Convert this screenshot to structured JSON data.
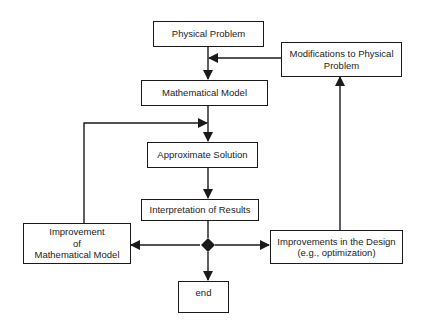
{
  "diagram": {
    "nodes": {
      "physical_problem": "Physical Problem",
      "modifications": "Modifications to Physical\nProblem",
      "mathematical_model": "Mathematical Model",
      "approximate_solution": "Approximate Solution",
      "interpretation": "Interpretation of Results",
      "improvement_model": "Improvement\nof\nMathematical Model",
      "improvements_design": "Improvements in the Design\n(e.g., optimization)",
      "end": "end"
    },
    "edges": [
      {
        "from": "physical_problem",
        "to": "mathematical_model"
      },
      {
        "from": "modifications",
        "to": "mathematical_model"
      },
      {
        "from": "mathematical_model",
        "to": "approximate_solution"
      },
      {
        "from": "improvement_model",
        "to": "approximate_solution"
      },
      {
        "from": "approximate_solution",
        "to": "interpretation"
      },
      {
        "from": "interpretation",
        "to": "decision"
      },
      {
        "from": "decision",
        "to": "improvement_model"
      },
      {
        "from": "decision",
        "to": "improvements_design"
      },
      {
        "from": "decision",
        "to": "end"
      },
      {
        "from": "improvements_design",
        "to": "modifications"
      }
    ],
    "colors": {
      "line": "#1a1a1a",
      "text": "#222222",
      "background": "#ffffff"
    }
  }
}
